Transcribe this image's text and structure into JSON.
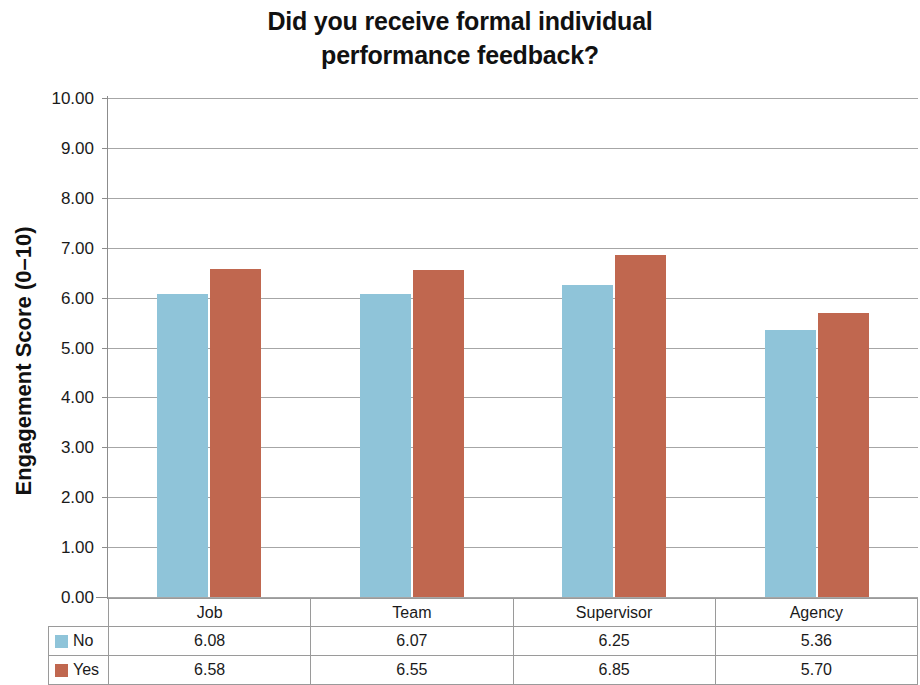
{
  "chart_data": {
    "type": "bar",
    "title": "Did you receive formal individual performance feedback?",
    "title_lines": [
      "Did you receive formal individual",
      "performance feedback?"
    ],
    "xlabel": "",
    "ylabel": "Engagement Score (0–10)",
    "ylim": [
      0,
      10
    ],
    "ytick_step": 1,
    "ytick_labels": [
      "10.00",
      "9.00",
      "8.00",
      "7.00",
      "6.00",
      "5.00",
      "4.00",
      "3.00",
      "2.00",
      "1.00",
      "0.00"
    ],
    "ytick_values": [
      10,
      9,
      8,
      7,
      6,
      5,
      4,
      3,
      2,
      1,
      0
    ],
    "grid": true,
    "grid_axis": "y",
    "legend_position": "table-below",
    "categories": [
      "Job",
      "Team",
      "Supervisor",
      "Agency"
    ],
    "series": [
      {
        "name": "No",
        "color": "#8fc4d9",
        "values": [
          6.08,
          6.07,
          6.25,
          5.36
        ],
        "value_labels": [
          "6.08",
          "6.07",
          "6.25",
          "5.36"
        ]
      },
      {
        "name": "Yes",
        "color": "#c0674f",
        "values": [
          6.58,
          6.55,
          6.85,
          5.7
        ],
        "value_labels": [
          "6.58",
          "6.55",
          "6.85",
          "5.70"
        ]
      }
    ]
  },
  "colors": {
    "series_no": "#8fc4d9",
    "series_yes": "#c0674f",
    "gridline": "#a6a6a6",
    "axis": "#8c8c8c",
    "text": "#1a1a1a",
    "background": "#ffffff"
  }
}
